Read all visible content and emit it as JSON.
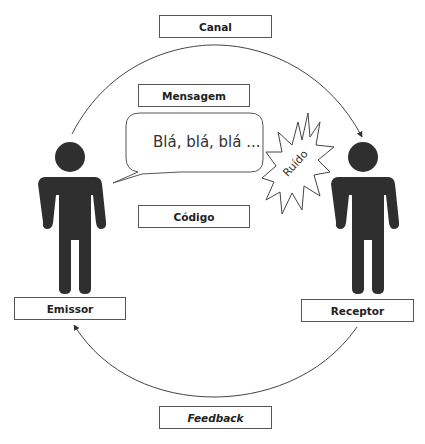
{
  "diagram": {
    "labels": {
      "channel": "Canal",
      "message": "Mensagem",
      "code": "Código",
      "sender": "Emissor",
      "receiver": "Receptor",
      "feedback": "Feedback"
    },
    "speech_bubble_text": "Blá, blá, blá ...",
    "noise_text": "Ruído",
    "colors": {
      "figure": "#2f2f2f",
      "line": "#444444",
      "box_border": "#555555"
    }
  }
}
